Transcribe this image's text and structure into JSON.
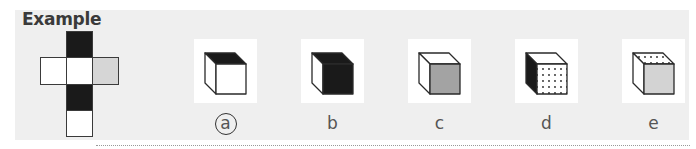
{
  "title": "Example",
  "net": {
    "description": "cube net (cross shape)",
    "cells": [
      {
        "row": 0,
        "col": 1,
        "fill": "black"
      },
      {
        "row": 1,
        "col": 0,
        "fill": "white"
      },
      {
        "row": 1,
        "col": 1,
        "fill": "white"
      },
      {
        "row": 1,
        "col": 2,
        "fill": "grey"
      },
      {
        "row": 2,
        "col": 1,
        "fill": "black"
      },
      {
        "row": 3,
        "col": 1,
        "fill": "white"
      }
    ]
  },
  "options": [
    {
      "label": "a",
      "selected": true,
      "top": "black",
      "front": "white",
      "side": "white"
    },
    {
      "label": "b",
      "selected": false,
      "top": "black",
      "front": "black",
      "side": "white"
    },
    {
      "label": "c",
      "selected": false,
      "top": "white",
      "front": "grey",
      "side": "white"
    },
    {
      "label": "d",
      "selected": false,
      "top": "white",
      "front": "dotted",
      "side": "black"
    },
    {
      "label": "e",
      "selected": false,
      "top": "dotted",
      "front": "lightgrey",
      "side": "white"
    }
  ],
  "colors": {
    "black": "#1a1a1a",
    "white": "#ffffff",
    "grey": "#a3a3a3",
    "lightgrey": "#d3d3d3",
    "netgrey": "#d6d6d6",
    "panel": "#efefef"
  }
}
